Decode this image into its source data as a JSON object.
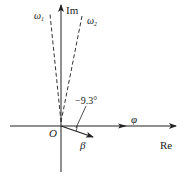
{
  "diagram": {
    "axes": {
      "imaginary_label": "Im",
      "real_label": "Re",
      "origin_label": "O"
    },
    "vectors": [
      {
        "name": "omega_1",
        "label": "ω",
        "subscript": "1",
        "style": "dashed"
      },
      {
        "name": "omega_2",
        "label": "ω",
        "subscript": "2",
        "style": "dashed"
      },
      {
        "name": "phi",
        "label": "φ",
        "style": "arrow-on-real-axis"
      },
      {
        "name": "beta",
        "label": "β",
        "style": "solid-arrow"
      }
    ],
    "angle_annotation": "−9.3°",
    "colors": {
      "line": "#222222",
      "background": "#ffffff"
    }
  }
}
